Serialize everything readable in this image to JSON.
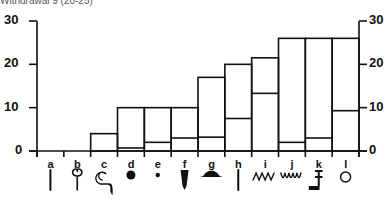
{
  "title": "Withdrawal 9 (20-25)",
  "chart_data": {
    "type": "bar",
    "title": "Withdrawal 9 (20-25)",
    "stacked": true,
    "categories": [
      "a",
      "b",
      "c",
      "d",
      "e",
      "f",
      "g",
      "h",
      "i",
      "j",
      "k",
      "l"
    ],
    "series": [
      {
        "name": "total",
        "values": [
          0,
          0,
          4,
          10,
          10,
          10,
          17,
          20,
          21.5,
          26,
          26,
          26
        ]
      },
      {
        "name": "inner",
        "values": [
          0,
          0,
          0,
          0.7,
          2,
          3,
          3.2,
          7.5,
          13.3,
          2,
          3,
          9.3
        ]
      }
    ],
    "ylim": [
      0,
      30
    ],
    "yticks": [
      0,
      10,
      20,
      30
    ],
    "ylabel": "",
    "xlabel": "",
    "axes": "left and right y-axes mirrored",
    "grid": false,
    "category_glyphs": [
      "vertical-stroke",
      "trefoil-stem",
      "spiral-hook",
      "filled-dot",
      "small-dot",
      "wedge-stroke",
      "filled-mound",
      "vertical-stroke",
      "zigzag",
      "wavy-line",
      "t-hook",
      "open-circle"
    ]
  },
  "yaxis": {
    "left_ticks": [
      "30",
      "20",
      "10",
      "0"
    ],
    "right_ticks": [
      "30",
      "20",
      "10",
      "0"
    ]
  }
}
